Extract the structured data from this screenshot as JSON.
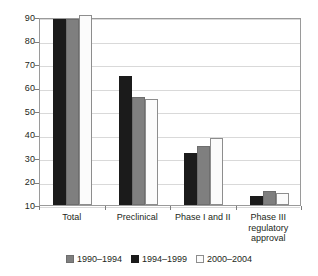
{
  "chart_data": {
    "type": "bar",
    "title": "",
    "subtitle": "",
    "xlabel": "",
    "ylabel": "",
    "ylim": [
      10,
      90
    ],
    "yticks": [
      10,
      20,
      30,
      40,
      50,
      60,
      70,
      80,
      90
    ],
    "grid": true,
    "legend_position": "bottom",
    "categories": [
      "Total",
      "Preclinical",
      "Phase I and II",
      "Phase III regulatory approval"
    ],
    "category_label_lines": [
      [
        "Total"
      ],
      [
        "Preclinical"
      ],
      [
        "Phase I and II"
      ],
      [
        "Phase III",
        "regulatory",
        "approval"
      ]
    ],
    "series": [
      {
        "name": "1990–1994",
        "color": "#7f7f7f",
        "swatch": "gray",
        "draw_order": 2,
        "values": [
          89,
          56,
          35,
          16
        ]
      },
      {
        "name": "1994–1999",
        "color": "#1b1b1b",
        "swatch": "black",
        "draw_order": 1,
        "values": [
          89,
          65,
          32,
          14
        ]
      },
      {
        "name": "2000–2004",
        "color": "#fbfbfb",
        "swatch": "white",
        "draw_order": 3,
        "values": [
          91,
          55,
          38.5,
          15
        ]
      }
    ],
    "bar_draw_order": [
      "1994–1999",
      "1990–1994",
      "2000–2004"
    ]
  },
  "legend": {
    "items": [
      {
        "label": "1990–1994",
        "swatch": "gray"
      },
      {
        "label": "1994–1999",
        "swatch": "black"
      },
      {
        "label": "2000–2004",
        "swatch": "white"
      }
    ]
  },
  "colors": {
    "series_gray": "#7f7f7f",
    "series_black": "#1b1b1b",
    "series_white": "#fbfbfb",
    "gridline": "#d9d9d9",
    "axis": "#7d7d7d",
    "text": "#231f20",
    "background": "#ffffff"
  }
}
